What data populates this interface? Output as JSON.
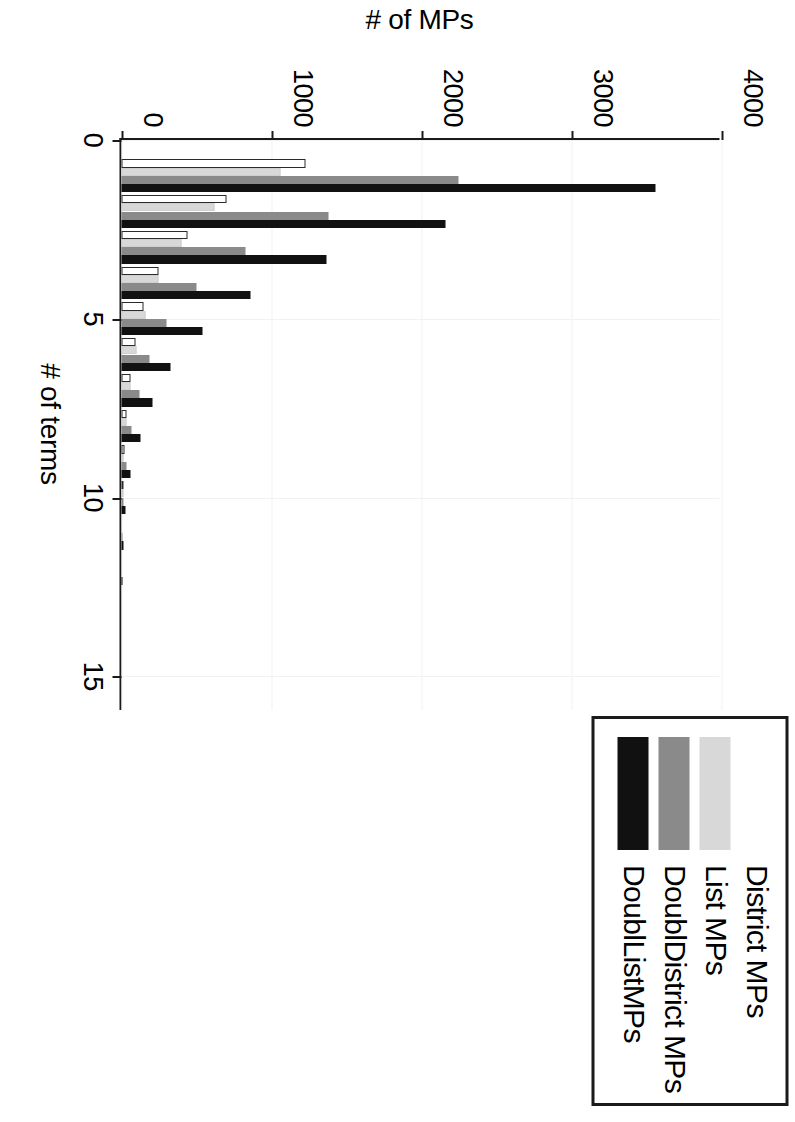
{
  "chart_data": {
    "type": "bar",
    "title": "",
    "xlabel": "# of terms",
    "ylabel": "# of MPs",
    "xlim": [
      0,
      16
    ],
    "ylim": [
      0,
      4000
    ],
    "xticks": [
      "0",
      "5",
      "10",
      "15"
    ],
    "xtick_values": [
      0,
      5,
      10,
      15
    ],
    "yticks": [
      "0",
      "1000",
      "2000",
      "3000",
      "4000"
    ],
    "ytick_values": [
      0,
      1000,
      2000,
      3000,
      4000
    ],
    "grid": true,
    "grid_axis": "both",
    "legend_position": "top-right",
    "orientation": "vertical",
    "categories": [
      1,
      2,
      3,
      4,
      5,
      6,
      7,
      8,
      9,
      10,
      11,
      12
    ],
    "series": [
      {
        "name": "District MPs",
        "color": "#ffffff",
        "values": [
          1230,
          700,
          440,
          250,
          150,
          95,
          60,
          35,
          18,
          9,
          0,
          0
        ]
      },
      {
        "name": "List MPs",
        "color": "#d8d8d8",
        "values": [
          1060,
          620,
          400,
          245,
          160,
          100,
          62,
          34,
          16,
          6,
          0,
          0
        ]
      },
      {
        "name": "DoublDistrict MPs",
        "color": "#8a8a8a",
        "values": [
          2250,
          1380,
          830,
          500,
          300,
          190,
          120,
          70,
          34,
          16,
          6,
          0
        ]
      },
      {
        "name": "DoublListMPs",
        "color": "#111111",
        "values": [
          3560,
          2160,
          1370,
          860,
          540,
          330,
          210,
          125,
          62,
          28,
          11,
          4
        ]
      }
    ]
  },
  "legend": {
    "items": [
      {
        "label": "District MPs",
        "swatch_class": "sw-district"
      },
      {
        "label": "List MPs",
        "swatch_class": "sw-list"
      },
      {
        "label": "DoublDistrict MPs",
        "swatch_class": "sw-ddistrict"
      },
      {
        "label": "DoublListMPs",
        "swatch_class": "sw-dlist"
      }
    ]
  },
  "colors": {
    "district": "#ffffff",
    "list": "#d8d8d8",
    "doubl_district": "#8a8a8a",
    "doubl_list": "#111111",
    "axis": "#1a1a1a",
    "grid": "#f2f2f2",
    "background": "#ffffff"
  }
}
